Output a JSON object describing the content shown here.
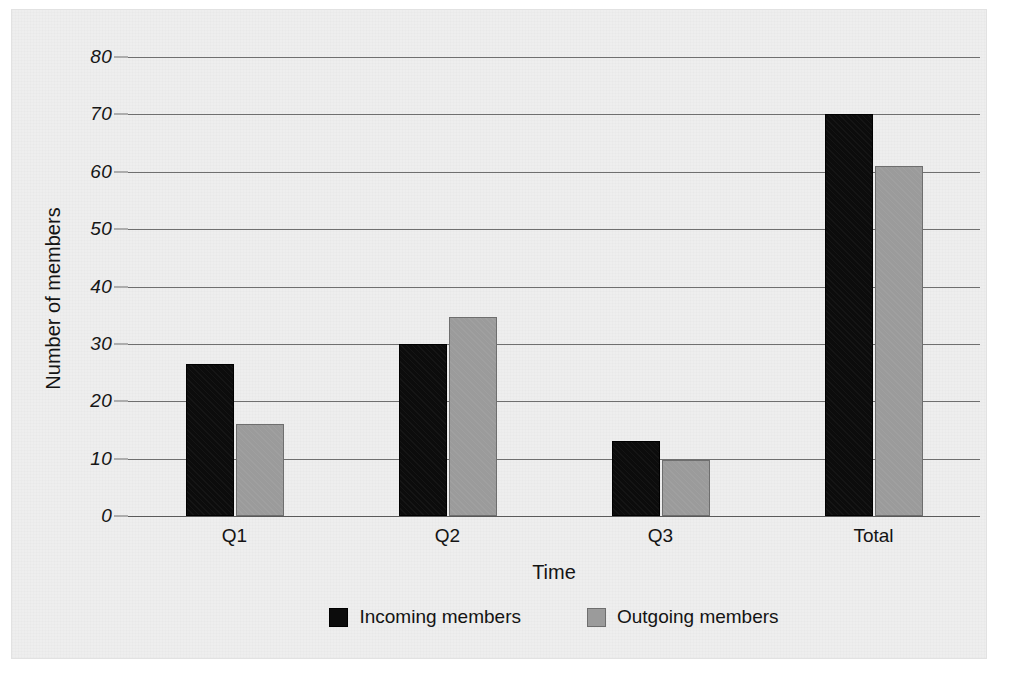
{
  "chart_data": {
    "type": "bar",
    "title": "",
    "xlabel": "Time",
    "ylabel": "Number of members",
    "categories": [
      "Q1",
      "Q2",
      "Q3",
      "Total"
    ],
    "series": [
      {
        "name": "Incoming members",
        "color": "#0c0c0c",
        "values": [
          26.5,
          30,
          13,
          70
        ]
      },
      {
        "name": "Outgoing members",
        "color": "#9b9b9b",
        "values": [
          16,
          34.7,
          9.8,
          61
        ]
      }
    ],
    "ylim": [
      0,
      80
    ],
    "yticks": [
      0,
      10,
      20,
      30,
      40,
      50,
      60,
      70,
      80
    ],
    "ytick_labels": [
      "0",
      "10",
      "20",
      "30",
      "40",
      "50",
      "60",
      "70",
      "80"
    ],
    "grid": true,
    "legend_position": "bottom"
  }
}
